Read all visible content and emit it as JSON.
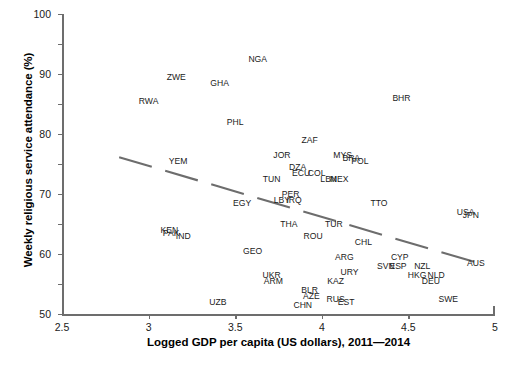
{
  "chart_data": {
    "type": "scatter",
    "title": "",
    "xlabel": "Logged GDP per capita (US dollars), 2011—2014",
    "ylabel": "Weekly religious service attendance (%)",
    "xlim": [
      2.5,
      5
    ],
    "ylim": [
      0,
      100
    ],
    "xticks": [
      "2.5",
      "3",
      "3.5",
      "4",
      "4.5",
      "5"
    ],
    "yticks": [
      "0",
      "10",
      "20",
      "30",
      "40",
      "50",
      "60",
      "70",
      "80",
      "90",
      "100"
    ],
    "grid": false,
    "legend": "none",
    "point_label_style": "country-iso3-code",
    "trend": {
      "style": "dashed",
      "color": "#6d6d6d",
      "description": "downward-sloping fitted line from upper-left to lower-right"
    },
    "points": [
      {
        "label": "NGA",
        "x": 3.63,
        "y": 85
      },
      {
        "label": "ZWE",
        "x": 3.16,
        "y": 79
      },
      {
        "label": "GHA",
        "x": 3.41,
        "y": 77
      },
      {
        "label": "RWA",
        "x": 3.0,
        "y": 71
      },
      {
        "label": "BHR",
        "x": 4.46,
        "y": 72
      },
      {
        "label": "PHL",
        "x": 3.5,
        "y": 64
      },
      {
        "label": "ZAF",
        "x": 3.93,
        "y": 58
      },
      {
        "label": "YEM",
        "x": 3.17,
        "y": 51
      },
      {
        "label": "JOR",
        "x": 3.77,
        "y": 53
      },
      {
        "label": "MYS",
        "x": 4.12,
        "y": 53
      },
      {
        "label": "BRA",
        "x": 4.17,
        "y": 52
      },
      {
        "label": "POL",
        "x": 4.22,
        "y": 51
      },
      {
        "label": "DZA",
        "x": 3.86,
        "y": 49
      },
      {
        "label": "ECU",
        "x": 3.88,
        "y": 47
      },
      {
        "label": "COL",
        "x": 3.97,
        "y": 47
      },
      {
        "label": "TUN",
        "x": 3.71,
        "y": 45
      },
      {
        "label": "LBN",
        "x": 4.04,
        "y": 45
      },
      {
        "label": "MEX",
        "x": 4.1,
        "y": 45
      },
      {
        "label": "PER",
        "x": 3.82,
        "y": 40
      },
      {
        "label": "LBY",
        "x": 3.77,
        "y": 38
      },
      {
        "label": "IRQ",
        "x": 3.84,
        "y": 38
      },
      {
        "label": "EGY",
        "x": 3.54,
        "y": 37
      },
      {
        "label": "TTO",
        "x": 4.33,
        "y": 37
      },
      {
        "label": "USA",
        "x": 4.83,
        "y": 34
      },
      {
        "label": "JPN",
        "x": 4.86,
        "y": 33
      },
      {
        "label": "THA",
        "x": 3.81,
        "y": 30
      },
      {
        "label": "TUR",
        "x": 4.07,
        "y": 30
      },
      {
        "label": "KEN",
        "x": 3.12,
        "y": 28
      },
      {
        "label": "PAK",
        "x": 3.13,
        "y": 27
      },
      {
        "label": "IND",
        "x": 3.2,
        "y": 26
      },
      {
        "label": "ROU",
        "x": 3.95,
        "y": 26
      },
      {
        "label": "CHL",
        "x": 4.24,
        "y": 24
      },
      {
        "label": "GEO",
        "x": 3.6,
        "y": 21
      },
      {
        "label": "ARG",
        "x": 4.13,
        "y": 19
      },
      {
        "label": "CYP",
        "x": 4.45,
        "y": 19
      },
      {
        "label": "AUS",
        "x": 4.89,
        "y": 17
      },
      {
        "label": "SVN",
        "x": 4.37,
        "y": 16
      },
      {
        "label": "ESP",
        "x": 4.44,
        "y": 16
      },
      {
        "label": "NZL",
        "x": 4.58,
        "y": 16
      },
      {
        "label": "URY",
        "x": 4.16,
        "y": 14
      },
      {
        "label": "HKG",
        "x": 4.55,
        "y": 13
      },
      {
        "label": "NLD",
        "x": 4.66,
        "y": 13
      },
      {
        "label": "DEU",
        "x": 4.63,
        "y": 11
      },
      {
        "label": "UKR",
        "x": 3.71,
        "y": 13
      },
      {
        "label": "ARM",
        "x": 3.72,
        "y": 11
      },
      {
        "label": "KAZ",
        "x": 4.08,
        "y": 11
      },
      {
        "label": "BLR",
        "x": 3.93,
        "y": 8
      },
      {
        "label": "AZE",
        "x": 3.94,
        "y": 6
      },
      {
        "label": "RUS",
        "x": 4.08,
        "y": 5
      },
      {
        "label": "EST",
        "x": 4.14,
        "y": 4
      },
      {
        "label": "SWE",
        "x": 4.73,
        "y": 5
      },
      {
        "label": "CHN",
        "x": 3.89,
        "y": 3
      },
      {
        "label": "UZB",
        "x": 3.4,
        "y": 4
      }
    ]
  },
  "colors": {
    "axis": "#6d6d6d",
    "text": "#1a1a1a",
    "trend": "#6d6d6d",
    "background": "#ffffff"
  }
}
